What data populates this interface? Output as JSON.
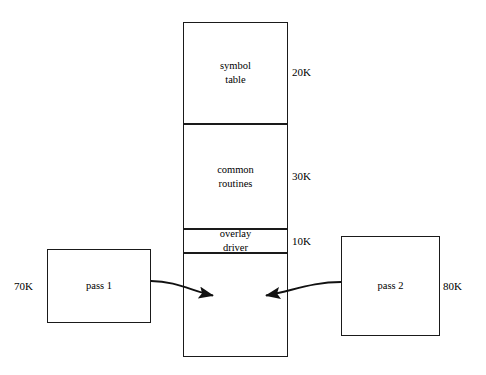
{
  "diagram": {
    "type": "memory-layout-overlay-diagram",
    "memory_column": {
      "name": "memory-map",
      "segments": [
        {
          "id": "symbol-table",
          "label": "symbol\ntable",
          "size": "20K",
          "x": 183,
          "y": 22,
          "w": 105,
          "h": 102
        },
        {
          "id": "common-routines",
          "label": "common\nroutines",
          "size": "30K",
          "x": 183,
          "y": 124,
          "w": 105,
          "h": 105
        },
        {
          "id": "overlay-driver",
          "label": "overlay\ndriver",
          "size": "10K",
          "x": 183,
          "y": 229,
          "w": 105,
          "h": 24
        },
        {
          "id": "overlay-area",
          "label": "",
          "size": "",
          "x": 183,
          "y": 253,
          "w": 105,
          "h": 104
        }
      ],
      "size_labels": [
        {
          "id": "size-symbol-table",
          "text": "20K",
          "x": 292,
          "y": 65
        },
        {
          "id": "size-common-routines",
          "text": "30K",
          "x": 292,
          "y": 169
        },
        {
          "id": "size-overlay-driver",
          "text": "10K",
          "x": 292,
          "y": 234
        }
      ]
    },
    "pass_boxes": [
      {
        "id": "pass-1",
        "label": "pass 1",
        "size": "70K",
        "x": 47,
        "y": 249,
        "w": 104,
        "h": 74,
        "size_x": 14,
        "size_y": 279
      },
      {
        "id": "pass-2",
        "label": "pass 2",
        "size": "80K",
        "x": 341,
        "y": 236,
        "w": 99,
        "h": 100,
        "size_x": 443,
        "size_y": 279
      }
    ],
    "arrows": [
      {
        "id": "arrow-pass-1-to-memory",
        "from": "pass-1",
        "to": "overlay-area",
        "direction": "right"
      },
      {
        "id": "arrow-pass-2-to-memory",
        "from": "pass-2",
        "to": "overlay-area",
        "direction": "left"
      }
    ],
    "colors": {
      "stroke": "#1a1a1a",
      "text": "#000000",
      "background": "#ffffff"
    }
  }
}
